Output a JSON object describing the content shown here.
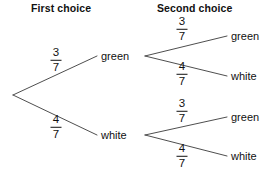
{
  "diagram": {
    "type": "probability-tree",
    "headers": {
      "first": "First choice",
      "second": "Second choice"
    },
    "stage1": {
      "branches": [
        {
          "outcome": "green",
          "probability": {
            "numerator": "3",
            "denominator": "7"
          }
        },
        {
          "outcome": "white",
          "probability": {
            "numerator": "4",
            "denominator": "7"
          }
        }
      ]
    },
    "stage2_from_green": {
      "branches": [
        {
          "outcome": "green",
          "probability": {
            "numerator": "3",
            "denominator": "7"
          }
        },
        {
          "outcome": "white",
          "probability": {
            "numerator": "4",
            "denominator": "7"
          }
        }
      ]
    },
    "stage2_from_white": {
      "branches": [
        {
          "outcome": "green",
          "probability": {
            "numerator": "3",
            "denominator": "7"
          }
        },
        {
          "outcome": "white",
          "probability": {
            "numerator": "4",
            "denominator": "7"
          }
        }
      ]
    },
    "colors": {
      "line": "#3a3a3a",
      "text": "#111111",
      "background": "#ffffff"
    }
  }
}
